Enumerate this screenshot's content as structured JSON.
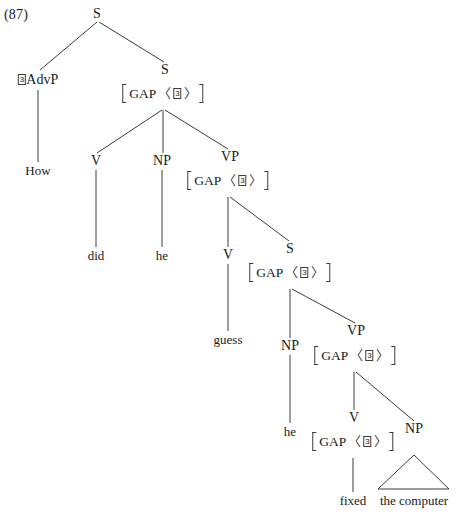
{
  "figure": {
    "example_number": "(87)",
    "sentence": "How did he guess he fixed the computer",
    "notation": {
      "gap_label": "GAP",
      "index": "3",
      "angle_open": "〈",
      "angle_close": "〉"
    },
    "colors": {
      "line": "#3c3c3c",
      "text": "#1a1a1a",
      "background": "#ffffff"
    }
  },
  "nodes": {
    "s_root": {
      "label": "S",
      "x": 97,
      "y": 14
    },
    "advp": {
      "label": "AdvP",
      "index": "3",
      "x": 38,
      "y": 80
    },
    "how": {
      "label": "How",
      "x": 38,
      "y": 170
    },
    "s_embedded1": {
      "label": "S",
      "x": 165,
      "y": 70
    },
    "gap_s1": {
      "label": "GAP",
      "index": "3",
      "x": 163,
      "y": 95
    },
    "v_did": {
      "label": "V",
      "x": 96,
      "y": 161
    },
    "did": {
      "label": "did",
      "x": 96,
      "y": 255
    },
    "np_he1": {
      "label": "NP",
      "x": 162,
      "y": 161
    },
    "he1": {
      "label": "he",
      "x": 162,
      "y": 255
    },
    "vp1": {
      "label": "VP",
      "x": 230,
      "y": 157
    },
    "gap_vp1": {
      "label": "GAP",
      "index": "3",
      "x": 228,
      "y": 182
    },
    "v_guess": {
      "label": "V",
      "x": 228,
      "y": 255
    },
    "guess": {
      "label": "guess",
      "x": 228,
      "y": 339
    },
    "s_embedded2": {
      "label": "S",
      "x": 290,
      "y": 249
    },
    "gap_s2": {
      "label": "GAP",
      "index": "3",
      "x": 290,
      "y": 274
    },
    "np_he2": {
      "label": "NP",
      "x": 290,
      "y": 346
    },
    "he2": {
      "label": "he",
      "x": 290,
      "y": 431
    },
    "vp2": {
      "label": "VP",
      "x": 356,
      "y": 331
    },
    "gap_vp2": {
      "label": "GAP",
      "index": "3",
      "x": 355,
      "y": 357
    },
    "v_fixed": {
      "label": "V",
      "x": 354,
      "y": 418
    },
    "gap_v_fixed": {
      "label": "GAP",
      "index": "3",
      "x": 353,
      "y": 443
    },
    "fixed": {
      "label": "fixed",
      "x": 353,
      "y": 500
    },
    "np_computer": {
      "label": "NP",
      "x": 414,
      "y": 429
    },
    "the_computer": {
      "label": "the computer",
      "x": 414,
      "y": 500
    }
  },
  "edges": [
    {
      "from": "s_root",
      "to": "advp"
    },
    {
      "from": "s_root",
      "to": "s_embedded1"
    },
    {
      "from": "advp",
      "to": "how"
    },
    {
      "from": "gap_s1",
      "to": "v_did"
    },
    {
      "from": "gap_s1",
      "to": "np_he1"
    },
    {
      "from": "gap_s1",
      "to": "vp1"
    },
    {
      "from": "v_did",
      "to": "did"
    },
    {
      "from": "np_he1",
      "to": "he1"
    },
    {
      "from": "gap_vp1",
      "to": "v_guess"
    },
    {
      "from": "gap_vp1",
      "to": "s_embedded2"
    },
    {
      "from": "v_guess",
      "to": "guess"
    },
    {
      "from": "gap_s2",
      "to": "np_he2"
    },
    {
      "from": "gap_s2",
      "to": "vp2"
    },
    {
      "from": "np_he2",
      "to": "he2"
    },
    {
      "from": "gap_vp2",
      "to": "v_fixed"
    },
    {
      "from": "gap_vp2",
      "to": "np_computer"
    },
    {
      "from": "gap_v_fixed",
      "to": "fixed"
    }
  ],
  "triangle": {
    "label": "the computer",
    "apex_x": 414,
    "apex_y": 455,
    "left_x": 378,
    "right_x": 449,
    "base_y": 489
  }
}
